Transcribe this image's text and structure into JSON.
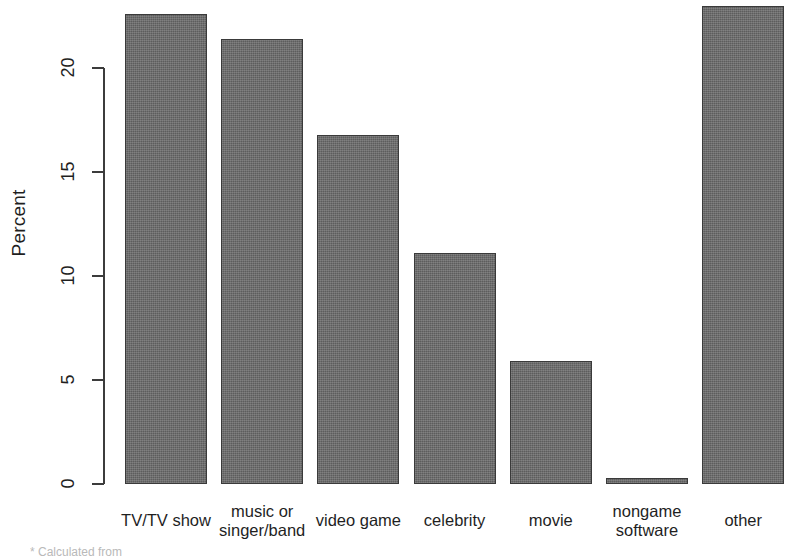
{
  "chart_data": {
    "type": "bar",
    "title": "",
    "subtitle": "",
    "xlabel": "",
    "ylabel": "Percent",
    "categories": [
      "TV/TV show",
      "music or\nsinger/band",
      "video game",
      "celebrity",
      "movie",
      "nongame\nsoftware",
      "other"
    ],
    "values": [
      22.6,
      21.4,
      16.8,
      11.1,
      5.9,
      0.3,
      23.0
    ],
    "ylim": [
      0,
      22.6
    ],
    "y_ticks": [
      0,
      5,
      10,
      15,
      20
    ],
    "y_tick_labels": [
      "0",
      "5",
      "10",
      "15",
      "20"
    ],
    "grid": false,
    "legend": false,
    "bar_color": "#5d5d5d",
    "bar_border_color": "#3a3a3a",
    "axis_color": "#3c3c3c",
    "background": "#ffffff"
  },
  "footnote": {
    "text": "* Calculated from"
  }
}
